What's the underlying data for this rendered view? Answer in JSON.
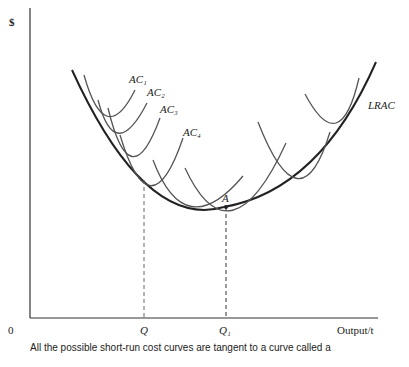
{
  "y_axis_label": "$",
  "origin_label": "0",
  "x_ticks": {
    "q": "Q",
    "q1": "Q₁"
  },
  "x_axis_label": "Output/t",
  "curve_labels": {
    "ac1": "AC₁",
    "ac2": "AC₂",
    "ac3": "AC₃",
    "ac4": "AC₄",
    "lrac": "LRAC",
    "a": "A"
  },
  "caption": "All the possible short-run cost curves are tangent to a curve called a"
}
